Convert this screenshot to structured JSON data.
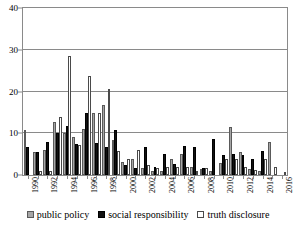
{
  "chart_data": {
    "type": "bar",
    "title": "",
    "subtitle": "",
    "xlabel": "",
    "ylabel": "",
    "ylim": [
      0,
      40
    ],
    "yticks": [
      0,
      10,
      20,
      30,
      40
    ],
    "grid": true,
    "legend_position": "bottom",
    "categories": [
      "1990",
      "1991",
      "1992",
      "1993",
      "1994",
      "1995",
      "1996",
      "1997",
      "1998",
      "1999",
      "2000",
      "2001",
      "2002",
      "2003",
      "2004",
      "2005",
      "2006",
      "2007",
      "2008",
      "2009",
      "2010",
      "2011",
      "2012",
      "2013",
      "2014",
      "2015",
      "2016"
    ],
    "tick_labels": [
      "1990",
      "",
      "1992",
      "",
      "1994",
      "",
      "1996",
      "",
      "1998",
      "",
      "2000",
      "",
      "2002",
      "",
      "2004",
      "",
      "2006",
      "",
      "2008",
      "",
      "2010",
      "",
      "2012",
      "",
      "2014",
      "",
      "2016"
    ],
    "series": [
      {
        "name": "public policy",
        "color": "#a6a6a6",
        "values": [
          10.8,
          5.4,
          6.1,
          12.8,
          10.0,
          9.0,
          11.0,
          14.9,
          16.8,
          8.4,
          3.0,
          3.9,
          1.6,
          1.0,
          1.0,
          3.9,
          5.0,
          1.9,
          1.4,
          1.0,
          2.9,
          11.6,
          5.6,
          1.5,
          1.0,
          7.8,
          0.0
        ]
      },
      {
        "name": "social responsibility",
        "color": "#111111",
        "values": [
          6.8,
          5.6,
          7.9,
          10.0,
          11.7,
          7.4,
          14.8,
          7.6,
          6.8,
          10.8,
          2.5,
          1.7,
          6.8,
          2.0,
          5.0,
          2.6,
          6.9,
          6.8,
          1.7,
          8.7,
          4.9,
          5.0,
          4.9,
          3.9,
          5.8,
          0.0,
          0.0
        ]
      },
      {
        "name": "truth disclosure",
        "color": "#ffffff",
        "values": [
          0.0,
          1.0,
          1.0,
          13.8,
          28.5,
          7.2,
          23.7,
          14.8,
          20.7,
          5.8,
          3.9,
          5.9,
          2.4,
          1.8,
          1.9,
          1.9,
          2.0,
          1.0,
          1.7,
          0.0,
          3.8,
          3.9,
          2.0,
          1.1,
          3.8,
          1.9,
          0.8
        ]
      }
    ]
  },
  "legend": {
    "items": [
      {
        "label": "public policy"
      },
      {
        "label": "social responsibility"
      },
      {
        "label": "truth disclosure"
      }
    ]
  }
}
